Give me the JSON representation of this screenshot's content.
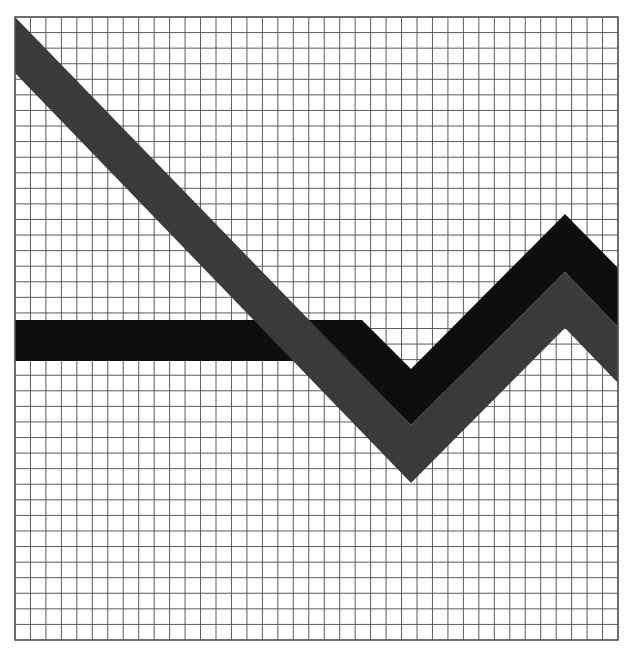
{
  "title": {
    "text": "",
    "note": "Large title text cut off at top edge; only faint bottoms of letters visible"
  },
  "colors": {
    "background": "#ffffff",
    "grid_line": "#5a5a5a",
    "band_black": "#0e0e0e",
    "band_gray": "#3b3b3b"
  },
  "grid": {
    "left": 15,
    "top": 17,
    "right": 618,
    "bottom": 640,
    "columns": 39,
    "rows": 40
  },
  "chart_data": {
    "type": "line",
    "title": "",
    "xlabel": "",
    "ylabel": "",
    "grid": true,
    "legend": null,
    "x_units": "grid columns (0 = left edge, 39 = right edge)",
    "y_units": "grid rows from bottom (0 = bottom edge, 40 = top edge)",
    "xlim": [
      0,
      39
    ],
    "ylim": [
      0,
      40
    ],
    "series": [
      {
        "name": "black band",
        "color": "#0e0e0e",
        "style": "thick band drawn beneath gray band",
        "x": [
          0,
          22.4,
          25.6,
          35.5,
          39
        ],
        "y_top": [
          20.6,
          20.6,
          17.4,
          27.4,
          23.9
        ],
        "y_bottom": [
          18.0,
          18.0,
          13.8,
          23.7,
          20.2
        ],
        "polygon_px": [
          [
            15,
            320
          ],
          [
            362,
            320
          ],
          [
            411,
            369
          ],
          [
            565,
            214
          ],
          [
            618,
            268
          ],
          [
            618,
            327
          ],
          [
            565,
            272
          ],
          [
            411,
            425
          ],
          [
            347,
            361
          ],
          [
            15,
            361
          ]
        ]
      },
      {
        "name": "gray band",
        "color": "#3b3b3b",
        "style": "thick band drawn over black band",
        "x": [
          0,
          25.6,
          35.5,
          39
        ],
        "y_top": [
          40.0,
          13.8,
          23.7,
          20.2
        ],
        "y_bottom": [
          36.4,
          10.1,
          20.1,
          16.6
        ],
        "polygon_px": [
          [
            15,
            17
          ],
          [
            411,
            425
          ],
          [
            565,
            272
          ],
          [
            618,
            327
          ],
          [
            618,
            383
          ],
          [
            565,
            328
          ],
          [
            411,
            483
          ],
          [
            15,
            73
          ]
        ]
      }
    ]
  }
}
